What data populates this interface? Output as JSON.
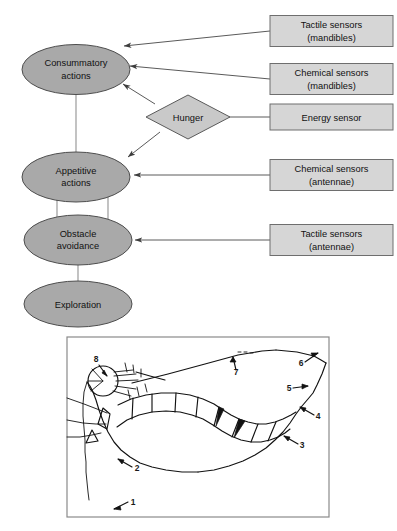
{
  "figure": {
    "colors": {
      "ellipse_fill": "#a9a9a9",
      "ellipse_stroke": "#4d4d4d",
      "diamond_fill": "#c9c9c9",
      "box_fill": "#d6d6d6",
      "box_stroke": "#6e6e6e",
      "connector": "#5a5a5a",
      "panel_border": "#8a8a8a",
      "ink": "#121212",
      "background": "#ffffff"
    }
  },
  "diagram": {
    "nodes": [
      {
        "id": "consummatory",
        "shape": "ellipse",
        "line1": "Consummatory",
        "line2": "actions"
      },
      {
        "id": "appetitive",
        "shape": "ellipse",
        "line1": "Appetitive",
        "line2": "actions"
      },
      {
        "id": "obstacle",
        "shape": "ellipse",
        "line1": "Obstacle",
        "line2": "avoidance"
      },
      {
        "id": "exploration",
        "shape": "ellipse",
        "line1": "Exploration",
        "line2": ""
      },
      {
        "id": "hunger",
        "shape": "diamond",
        "line1": "Hunger",
        "line2": ""
      }
    ],
    "sensor_boxes": [
      {
        "id": "tactile-mandibles",
        "line1": "Tactile sensors",
        "line2": "(mandibles)",
        "target": "consummatory"
      },
      {
        "id": "chemical-mandibles",
        "line1": "Chemical sensors",
        "line2": "(mandibles)",
        "target": "consummatory"
      },
      {
        "id": "energy-sensor",
        "line1": "Energy sensor",
        "line2": "",
        "target": "hunger"
      },
      {
        "id": "chemical-antennae",
        "line1": "Chemical sensors",
        "line2": "(antennae)",
        "target": "appetitive"
      },
      {
        "id": "tactile-antennae",
        "line1": "Tactile sensors",
        "line2": "(antennae)",
        "target": "obstacle"
      }
    ],
    "edges": [
      {
        "from": "hunger",
        "to": "consummatory",
        "arrow": true
      },
      {
        "from": "hunger",
        "to": "appetitive",
        "arrow": true
      },
      {
        "from": "consummatory",
        "to": "appetitive",
        "arrow": false
      },
      {
        "from": "appetitive",
        "to": "obstacle",
        "arrow": false
      },
      {
        "from": "obstacle",
        "to": "exploration",
        "arrow": false
      }
    ]
  },
  "panel": {
    "caption": "",
    "callouts": [
      {
        "id": "callout-1",
        "label": "1"
      },
      {
        "id": "callout-2",
        "label": "2"
      },
      {
        "id": "callout-3",
        "label": "3"
      },
      {
        "id": "callout-4",
        "label": "4"
      },
      {
        "id": "callout-5",
        "label": "5"
      },
      {
        "id": "callout-6",
        "label": "6"
      },
      {
        "id": "callout-7",
        "label": "7"
      },
      {
        "id": "callout-8",
        "label": "8"
      }
    ]
  }
}
